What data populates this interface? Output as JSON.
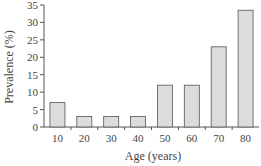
{
  "chart_data": {
    "type": "bar",
    "title": "",
    "xlabel": "Age (years)",
    "ylabel": "Prevalence (%)",
    "categories": [
      "10",
      "20",
      "30",
      "40",
      "50",
      "60",
      "70",
      "80"
    ],
    "values": [
      7,
      3,
      3,
      3,
      12,
      12,
      23,
      33.5
    ],
    "ylim": [
      0,
      35
    ],
    "yticks": [
      0,
      5,
      10,
      15,
      20,
      25,
      30,
      35
    ],
    "grid": false,
    "legend": null,
    "colors": {
      "bar_fill": "#dcdcdc",
      "bar_stroke": "#555555",
      "axis": "#555555"
    }
  }
}
